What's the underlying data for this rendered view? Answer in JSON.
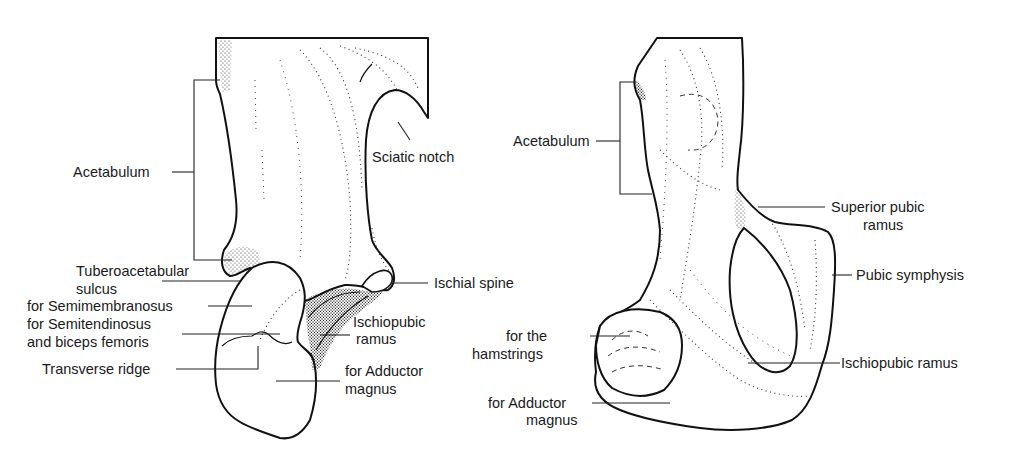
{
  "figure": {
    "left_view": {
      "name": "Ischium, posterior view",
      "labels": {
        "acetabulum": "Acetabulum",
        "sciatic_notch": "Sciatic notch",
        "tuberoacetabular_sulcus_1": "Tuberoacetabular",
        "tuberoacetabular_sulcus_2": "sulcus",
        "semimembranosus": "for Semimembranosus",
        "semitendinosus_1": "for Semitendinosus",
        "semitendinosus_2": "and biceps femoris",
        "transverse_ridge": "Transverse ridge",
        "ischial_spine": "Ischial spine",
        "ischiopubic_ramus_1": "Ischiopubic",
        "ischiopubic_ramus_2": "ramus",
        "adductor_magnus_1": "for Adductor",
        "adductor_magnus_2": "magnus"
      }
    },
    "right_view": {
      "name": "Ischium and pubis, lateral view",
      "labels": {
        "acetabulum": "Acetabulum",
        "superior_pubic_ramus_1": "Superior pubic",
        "superior_pubic_ramus_2": "ramus",
        "pubic_symphysis": "Pubic symphysis",
        "hamstrings_1": "for the",
        "hamstrings_2": "hamstrings",
        "ischiopubic_ramus": "Ischiopubic ramus",
        "adductor_magnus_1": "for Adductor",
        "adductor_magnus_2": "magnus"
      }
    },
    "colors": {
      "ink": "#111111",
      "paper": "#ffffff"
    }
  }
}
